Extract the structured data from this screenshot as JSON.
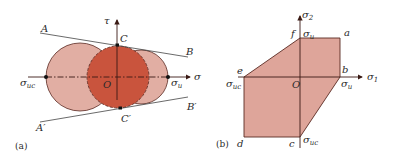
{
  "colors": {
    "light_fill": "#e1aea3",
    "dark_fill": "#c9543d",
    "poly_fill": "#dea59a",
    "stroke": "#5a2a22",
    "axis": "#3a1a14",
    "line": "#444444"
  },
  "panel_a": {
    "caption": "(a)",
    "axis_x_label": "σ",
    "axis_y_label": "τ",
    "origin_label": "O",
    "left_point": {
      "main": "σ",
      "sub": "uc"
    },
    "right_point": {
      "main": "σ",
      "sub": "u"
    },
    "tangent_upper": {
      "start": "A",
      "end": "B"
    },
    "tangent_lower": {
      "start": "A′",
      "end": "B′"
    },
    "top_point": "C",
    "bottom_point": "C′"
  },
  "panel_b": {
    "caption": "(b)",
    "axis_x_label": {
      "main": "σ",
      "sub": "1"
    },
    "axis_y_label": {
      "main": "σ",
      "sub": "2"
    },
    "origin_label": "O",
    "vertices": [
      "a",
      "b",
      "c",
      "d",
      "e",
      "f"
    ],
    "vertex_labels": {
      "a": "a",
      "b": "b",
      "c": "c",
      "d": "d",
      "e": "e",
      "f": "f"
    },
    "top_intercept": {
      "main": "σ",
      "sub": "u"
    },
    "right_intercept": {
      "main": "σ",
      "sub": "u"
    },
    "left_intercept": {
      "main": "σ",
      "sub": "uc"
    },
    "bottom_intercept": {
      "main": "σ",
      "sub": "uc"
    }
  }
}
